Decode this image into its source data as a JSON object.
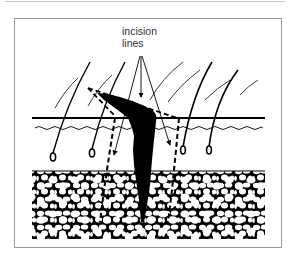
{
  "figure": {
    "annotation": {
      "line1": "incision",
      "line2": "lines"
    },
    "layers": [
      "hair shafts",
      "epidermis surface",
      "dermis",
      "hair follicles",
      "subcutaneous fat"
    ],
    "elements": {
      "wound": "ingrown hair / sinus tract (black)",
      "incision": "dashed excision outline",
      "arrows": 3
    },
    "colors": {
      "ink": "#000000",
      "frame": "#9a9a9a",
      "label": "#333333",
      "background": "#ffffff"
    }
  }
}
